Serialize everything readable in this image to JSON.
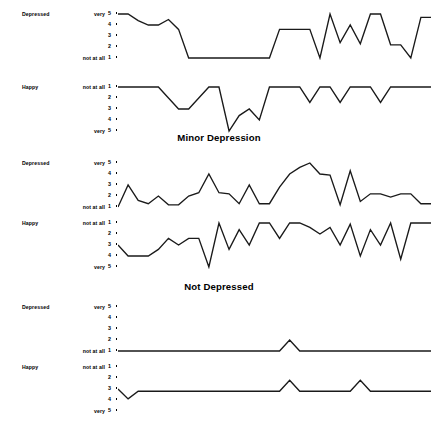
{
  "figure": {
    "scale_min": 1,
    "scale_max": 5,
    "line_color": "#1a1a1a",
    "background": "#ffffff"
  },
  "captions": {
    "minor_depression": "Minor Depression",
    "not_depressed": "Not Depressed"
  },
  "axis": {
    "depressed_ticks": [
      "5",
      "4",
      "3",
      "2",
      "1"
    ],
    "happy_ticks": [
      "1",
      "2",
      "3",
      "4",
      "5"
    ],
    "depressed_high_anchor": "very",
    "depressed_low_anchor": "not at all",
    "happy_high_anchor": "not at all",
    "happy_low_anchor": "very"
  },
  "chart_data": {
    "type": "line",
    "title": "",
    "xlabel": "",
    "ylabel": "",
    "ylim": [
      1,
      5
    ],
    "grid": false,
    "legend": false,
    "panels": [
      {
        "group": "",
        "mood": "Depressed",
        "high_anchor": "very",
        "low_anchor": "not at all",
        "tick_labels": [
          "5",
          "4",
          "3",
          "2",
          "1"
        ],
        "direction": "5-at-top",
        "values": [
          5,
          5,
          4.4,
          4,
          4,
          4.5,
          3.6,
          1,
          1,
          1,
          1,
          1,
          1,
          1,
          1,
          1,
          3.6,
          3.6,
          3.6,
          3.6,
          1,
          5,
          2.4,
          4,
          2.3,
          5,
          5,
          2.2,
          2.2,
          1,
          4.7,
          4.7
        ]
      },
      {
        "group": "",
        "mood": "Happy",
        "high_anchor": "not at all",
        "low_anchor": "very",
        "tick_labels": [
          "1",
          "2",
          "3",
          "4",
          "5"
        ],
        "direction": "1-at-top",
        "values": [
          1,
          1,
          1,
          1,
          1,
          2,
          3,
          3,
          2,
          1,
          1,
          5,
          3.6,
          3,
          4,
          1,
          1,
          1,
          1,
          2.4,
          1,
          1,
          2.4,
          1,
          1,
          1,
          2.4,
          1,
          1,
          1,
          1,
          1
        ]
      },
      {
        "group": "Minor Depression",
        "mood": "Depressed",
        "high_anchor": "very",
        "low_anchor": "not at all",
        "tick_labels": [
          "5",
          "4",
          "3",
          "2",
          "1"
        ],
        "direction": "5-at-top",
        "values": [
          1,
          3,
          1.6,
          1.3,
          2,
          1.2,
          1.2,
          2,
          2.3,
          4,
          2.3,
          2.2,
          1.3,
          3,
          1.3,
          1.3,
          2.8,
          4,
          4.6,
          5,
          4,
          3.9,
          1.2,
          4.3,
          1.5,
          2.2,
          2.2,
          1.9,
          2.2,
          2.2,
          1.3,
          1.3
        ]
      },
      {
        "group": "Minor Depression",
        "mood": "Happy",
        "high_anchor": "not at all",
        "low_anchor": "very",
        "tick_labels": [
          "1",
          "2",
          "3",
          "4",
          "5"
        ],
        "direction": "1-at-top",
        "values": [
          3,
          4,
          4,
          4,
          3.4,
          2.4,
          3,
          2.4,
          2.4,
          5,
          1,
          3.4,
          1.6,
          3,
          1,
          1,
          2.4,
          1,
          1,
          1.4,
          2,
          1.4,
          3,
          1.1,
          4,
          1.6,
          3,
          1,
          4.3,
          1,
          1,
          1
        ]
      },
      {
        "group": "Not Depressed",
        "mood": "Depressed",
        "high_anchor": "very",
        "low_anchor": "not at all",
        "tick_labels": [
          "5",
          "4",
          "3",
          "2",
          "1"
        ],
        "direction": "5-at-top",
        "values": [
          1,
          1,
          1,
          1,
          1,
          1,
          1,
          1,
          1,
          1,
          1,
          1,
          1,
          1,
          1,
          1,
          1,
          2,
          1,
          1,
          1,
          1,
          1,
          1,
          1,
          1,
          1,
          1,
          1,
          1,
          1,
          1
        ]
      },
      {
        "group": "Not Depressed",
        "mood": "Happy",
        "high_anchor": "not at all",
        "low_anchor": "very",
        "tick_labels": [
          "1",
          "2",
          "3",
          "4",
          "5"
        ],
        "direction": "1-at-top",
        "values": [
          3,
          3.9,
          3.2,
          3.2,
          3.2,
          3.2,
          3.2,
          3.2,
          3.2,
          3.2,
          3.2,
          3.2,
          3.2,
          3.2,
          3.2,
          3.2,
          3.2,
          2.2,
          3.2,
          3.2,
          3.2,
          3.2,
          3.2,
          3.2,
          2.2,
          3.2,
          3.2,
          3.2,
          3.2,
          3.2,
          3.2,
          3.2
        ]
      }
    ]
  }
}
